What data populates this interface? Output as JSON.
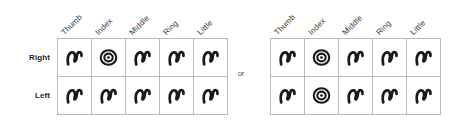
{
  "figure": {
    "separator_label": "or",
    "row_header_labels": [
      "Right",
      "Left"
    ],
    "column_header_labels": [
      "Thumb",
      "Index",
      "Middle",
      "Ring",
      "Little"
    ],
    "symbol_glyph_names": {
      "loop": "fingerprint-loop-icon",
      "whorl": "fingerprint-whorl-icon"
    },
    "colors": {
      "grid_line": "#b9b9bb",
      "glyph_ink": "#1a1a1a",
      "row_label_text": "#231f20",
      "column_label_text": "#3b3a3c",
      "separator_text": "#4a4a4c",
      "background": "#ffffff"
    }
  },
  "tables": [
    {
      "name": "fingerprint-pattern-table-left",
      "show_row_labels": true,
      "columns": [
        "Thumb",
        "Index",
        "Middle",
        "Ring",
        "Little"
      ],
      "rows": [
        {
          "label": "Right",
          "patterns": [
            "loop",
            "whorl",
            "loop",
            "loop",
            "loop"
          ]
        },
        {
          "label": "Left",
          "patterns": [
            "loop",
            "loop",
            "loop",
            "loop",
            "loop"
          ]
        }
      ]
    },
    {
      "name": "fingerprint-pattern-table-right",
      "show_row_labels": false,
      "columns": [
        "Thumb",
        "Index",
        "Middle",
        "Ring",
        "Little"
      ],
      "rows": [
        {
          "label": "Right",
          "patterns": [
            "loop",
            "whorl",
            "loop",
            "loop",
            "loop"
          ]
        },
        {
          "label": "Left",
          "patterns": [
            "loop",
            "whorl",
            "loop",
            "loop",
            "loop"
          ]
        }
      ]
    }
  ]
}
